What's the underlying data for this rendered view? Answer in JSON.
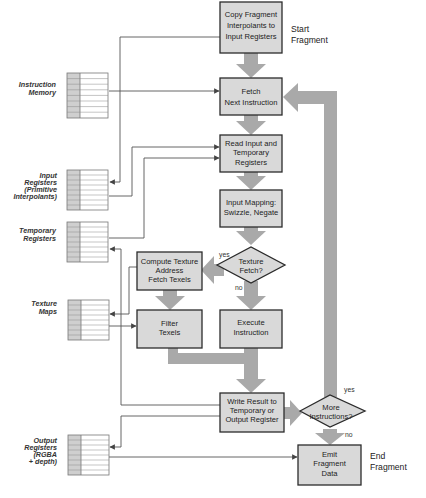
{
  "diagram": {
    "colors": {
      "box_fill": "#d9d9d9",
      "box_stroke": "#2b2b2b",
      "flow_arrow": "#a9a9a9",
      "wire": "#555555",
      "table_shade": "#cfcfcf",
      "table_stroke": "#777777"
    },
    "terminals": {
      "start": [
        "Start",
        "Fragment"
      ],
      "end": [
        "End",
        "Fragment"
      ]
    },
    "process_boxes": {
      "copy": [
        "Copy Fragment",
        "Interpolants to",
        "Input Registers"
      ],
      "fetch": [
        "Fetch",
        "Next Instruction"
      ],
      "read": [
        "Read Input and",
        "Temporary",
        "Registers"
      ],
      "mapping": [
        "Input Mapping:",
        "Swizzle, Negate"
      ],
      "compute": [
        "Compute Texture",
        "Address",
        "Fetch Texels"
      ],
      "filter": [
        "Filter",
        "Texels"
      ],
      "execute": [
        "Execute",
        "Instruction"
      ],
      "write": [
        "Write Result to",
        "Temporary or",
        "Output Register"
      ],
      "emit": [
        "Emit",
        "Fragment",
        "Data"
      ]
    },
    "decisions": {
      "texture_fetch": [
        "Texture",
        "Fetch?"
      ],
      "more_instructions": [
        "More",
        "Instructions?"
      ]
    },
    "branch_labels": {
      "texture_yes": "yes",
      "texture_no": "no",
      "more_yes": "yes",
      "more_no": "no"
    },
    "memories": {
      "instruction_memory": [
        "Instruction",
        "Memory"
      ],
      "input_registers": [
        "Input",
        "Registers",
        "(Primitive",
        "Interpolants)"
      ],
      "temporary_registers": [
        "Temporary",
        "Registers"
      ],
      "texture_maps": [
        "Texture",
        "Maps"
      ],
      "output_registers": [
        "Output",
        "Registers",
        "(RGBA",
        "+ depth)"
      ]
    }
  }
}
